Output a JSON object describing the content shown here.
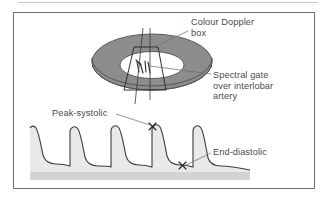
{
  "figure": {
    "type": "medical-diagram",
    "labels": {
      "colour_doppler_box": "Colour Doppler\nbox",
      "spectral_gate": "Spectral gate\nover interlobar\nartery",
      "peak_systolic": "Peak-systolic",
      "end_diastolic": "End-diastolic"
    },
    "markers": {
      "peak_systolic_x": "×",
      "end_diastolic_x": "×"
    },
    "colors": {
      "frame_border": "#6e6e6e",
      "top_rule": "#c9c9c9",
      "text": "#4a4a4a",
      "kidney_torus_top": "#8d8d8d",
      "kidney_torus_side": "#6f6f6f",
      "sinus_fill": "#ffffff",
      "doppler_box_stroke": "#3a3a3a",
      "waveform_stroke": "#3d3d3d",
      "waveform_fill": "#e9e9e9",
      "baseline_band": "#d3d3d3",
      "leader_line": "#6a6a6a"
    },
    "waveform": {
      "cycles": 5,
      "description": "Five cardiac cycles; tall sharp systolic peaks descending to low diastolic troughs, continuous forward flow above baseline"
    }
  }
}
